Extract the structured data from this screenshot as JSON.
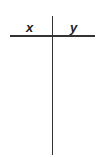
{
  "table": {
    "type": "t-chart",
    "headers": [
      "x",
      "y"
    ],
    "rows": []
  }
}
